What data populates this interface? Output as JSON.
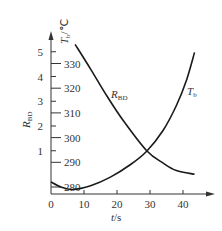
{
  "chart_data": {
    "type": "line",
    "title": "",
    "xlabel": "t/s",
    "ylabel_left": "R_BD",
    "ylabel_right": "T_b/℃",
    "xlim": [
      0,
      46
    ],
    "ylim_left": [
      0,
      5.5
    ],
    "ylim_right": [
      275,
      335
    ],
    "x_ticks": [
      0,
      10,
      20,
      30,
      40
    ],
    "y_left_ticks": [
      1,
      2,
      3,
      4,
      5
    ],
    "y_right_ticks": [
      280,
      290,
      300,
      310,
      320,
      330
    ],
    "grid": false,
    "legend": "inline curve labels",
    "series": [
      {
        "name": "R_BD",
        "axis": "left",
        "label_main": "R",
        "label_sub": "BD",
        "x": [
          7.3,
          12,
          17,
          22,
          29,
          34,
          38,
          43.5
        ],
        "values": [
          5.3,
          4.3,
          3.2,
          2.2,
          1.0,
          0.5,
          0.2,
          0.05
        ]
      },
      {
        "name": "T_b",
        "axis": "right",
        "label_main": "T",
        "label_sub": "b",
        "x": [
          0,
          3,
          6.5,
          12,
          18,
          24,
          29,
          34,
          38,
          41,
          43.5
        ],
        "values": [
          282,
          280,
          279,
          280.5,
          284,
          289,
          294.5,
          303,
          313,
          323,
          334.5
        ]
      }
    ]
  },
  "axes": {
    "x_tick_labels": [
      "0",
      "10",
      "20",
      "30",
      "40"
    ],
    "x_label_main": "t",
    "x_label_unit": "/s",
    "left_tick_labels": [
      "1",
      "2",
      "3",
      "4",
      "5"
    ],
    "left_label_main": "R",
    "left_label_sub": "BD",
    "right_tick_labels": [
      "280",
      "290",
      "300",
      "310",
      "320",
      "330"
    ],
    "right_label_main": "T",
    "right_label_sub": "b",
    "right_label_unit": "/℃"
  },
  "colors": {
    "line": "#1a1a1a",
    "axis": "#333333",
    "text": "#333333"
  }
}
